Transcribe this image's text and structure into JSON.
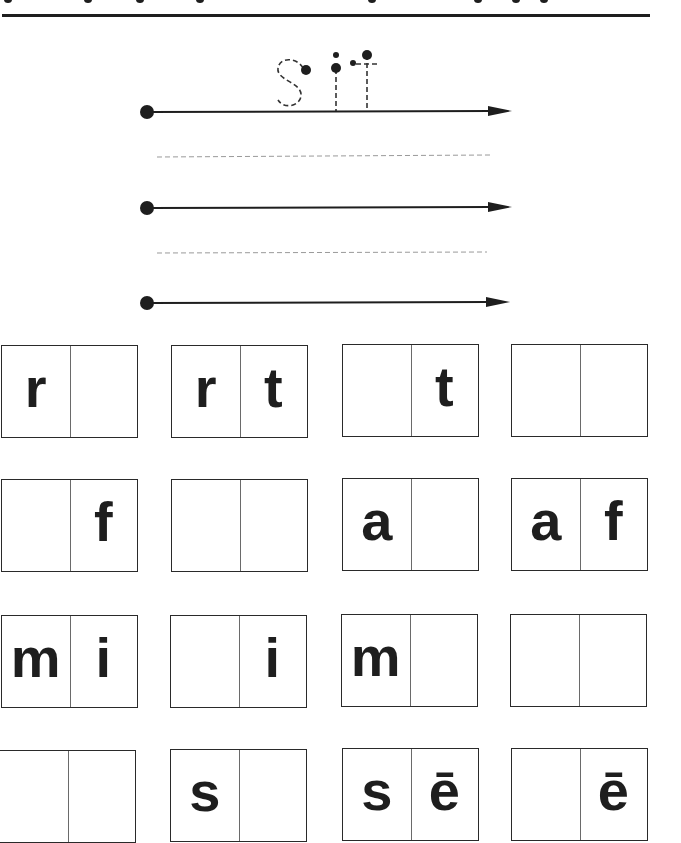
{
  "worksheet": {
    "trace_word": "sit",
    "trace_letters": [
      "s",
      "i",
      "t"
    ],
    "writing_lines": 3,
    "colors": {
      "ink": "#1e1e1e",
      "guide": "#9a9a9a",
      "paper": "#ffffff"
    }
  },
  "letter_boxes": [
    [
      {
        "left": "r",
        "right": ""
      },
      {
        "left": "r",
        "right": "t"
      },
      {
        "left": "",
        "right": "t"
      },
      {
        "left": "",
        "right": ""
      }
    ],
    [
      {
        "left": "",
        "right": "f"
      },
      {
        "left": "",
        "right": ""
      },
      {
        "left": "a",
        "right": ""
      },
      {
        "left": "a",
        "right": "f"
      }
    ],
    [
      {
        "left": "m",
        "right": "i"
      },
      {
        "left": "",
        "right": "i"
      },
      {
        "left": "m",
        "right": ""
      },
      {
        "left": "",
        "right": ""
      }
    ],
    [
      {
        "left": "",
        "right": ""
      },
      {
        "left": "s",
        "right": ""
      },
      {
        "left": "s",
        "right": "ē"
      },
      {
        "left": "",
        "right": "ē"
      }
    ]
  ]
}
